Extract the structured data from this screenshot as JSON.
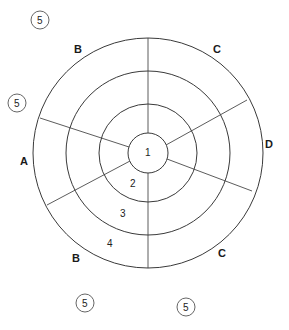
{
  "diagram": {
    "type": "concentric-ring-zone-diagram",
    "center": {
      "x": 148,
      "y": 153
    },
    "rings": [
      {
        "label": "1",
        "radius": 20
      },
      {
        "label": "2",
        "radius": 49
      },
      {
        "label": "3",
        "radius": 82
      },
      {
        "label": "4",
        "radius": 115
      }
    ],
    "sector_labels": [
      {
        "label": "B",
        "x": 78,
        "y": 52
      },
      {
        "label": "C",
        "x": 217,
        "y": 52
      },
      {
        "label": "A",
        "x": 24,
        "y": 164
      },
      {
        "label": "D",
        "x": 269,
        "y": 147
      },
      {
        "label": "B",
        "x": 76,
        "y": 261
      },
      {
        "label": "C",
        "x": 222,
        "y": 256
      }
    ],
    "ring_number_labels": [
      {
        "label": "1",
        "x": 145,
        "y": 156
      },
      {
        "label": "2",
        "x": 133,
        "y": 186
      },
      {
        "label": "3",
        "x": 123,
        "y": 216
      },
      {
        "label": "4",
        "x": 110,
        "y": 247
      }
    ],
    "outer_badges": [
      {
        "label": "5",
        "x": 40,
        "y": 20
      },
      {
        "label": "5",
        "x": 17,
        "y": 103
      },
      {
        "label": "5",
        "x": 85,
        "y": 303
      },
      {
        "label": "5",
        "x": 186,
        "y": 307
      }
    ]
  }
}
